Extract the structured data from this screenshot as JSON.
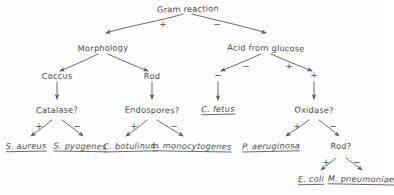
{
  "diagram": {
    "title": "Gram reaction",
    "style": "hand-drawn bacterial identification decision tree",
    "nodes": {
      "root": "Gram reaction",
      "morphology": "Morphology",
      "acid_from_glucose": "Acid from glucose",
      "coccus": "Coccus",
      "rod": "Rod",
      "catalase": "Catalase?",
      "endospores": "Endospores?",
      "c_fetus": "C. fetus",
      "oxidase": "Oxidase?",
      "rod2": "Rod?",
      "s_aureus": "S. aureus",
      "s_pyogenes": "S. pyogenes",
      "c_botulinum": "C. botulinum",
      "l_monocytogenes": "L. monocytogenes",
      "p_aeruginosa": "P. aeruginosa",
      "e_coli": "E. coli",
      "m_pneumoniae": "M. pneumoniae"
    },
    "edge_labels": {
      "root_left": "+",
      "root_right": "−",
      "acid_left": "−",
      "acid_right": "+",
      "catalase_left": "+",
      "catalase_right": "−",
      "endospores_left": "+",
      "endospores_right": "−",
      "oxidase_left": "+",
      "oxidase_right": "−",
      "rod2_left": "+",
      "rod2_right": "−"
    },
    "colors": {
      "ink": "#4a4a4a",
      "line": "#6a6a6a",
      "paper": "#fdfdfd"
    }
  }
}
